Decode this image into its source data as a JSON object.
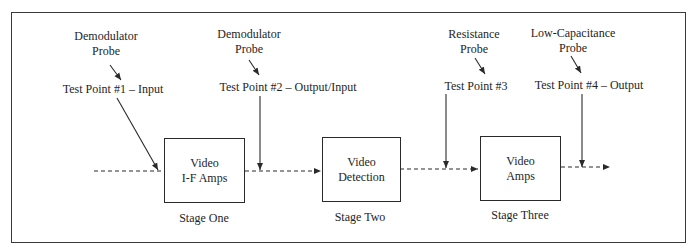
{
  "probes": [
    {
      "name_line1": "Demodulator",
      "name_line2": "Probe",
      "test_point": "Test Point #1 – Input"
    },
    {
      "name_line1": "Demodulator",
      "name_line2": "Probe",
      "test_point": "Test Point #2 – Output/Input"
    },
    {
      "name_line1": "Resistance",
      "name_line2": "Probe",
      "test_point": "Test Point #3"
    },
    {
      "name_line1": "Low-Capacitance",
      "name_line2": "Probe",
      "test_point": "Test Point #4 – Output"
    }
  ],
  "stages": [
    {
      "line1": "Video",
      "line2": "I-F Amps",
      "caption": "Stage One"
    },
    {
      "line1": "Video",
      "line2": "Detection",
      "caption": "Stage Two"
    },
    {
      "line1": "Video",
      "line2": "Amps",
      "caption": "Stage Three"
    }
  ]
}
